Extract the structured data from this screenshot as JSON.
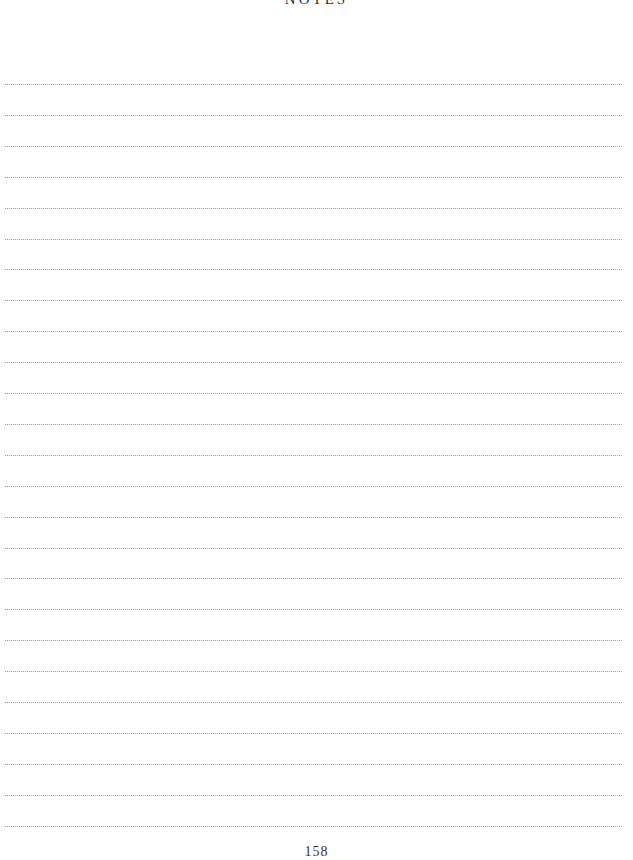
{
  "page": {
    "title": "NOTES",
    "page_number": "158"
  },
  "lines": {
    "count": 25,
    "first_y": 84,
    "spacing": 30.9,
    "style": "dotted",
    "color": "#9a9a9a"
  }
}
